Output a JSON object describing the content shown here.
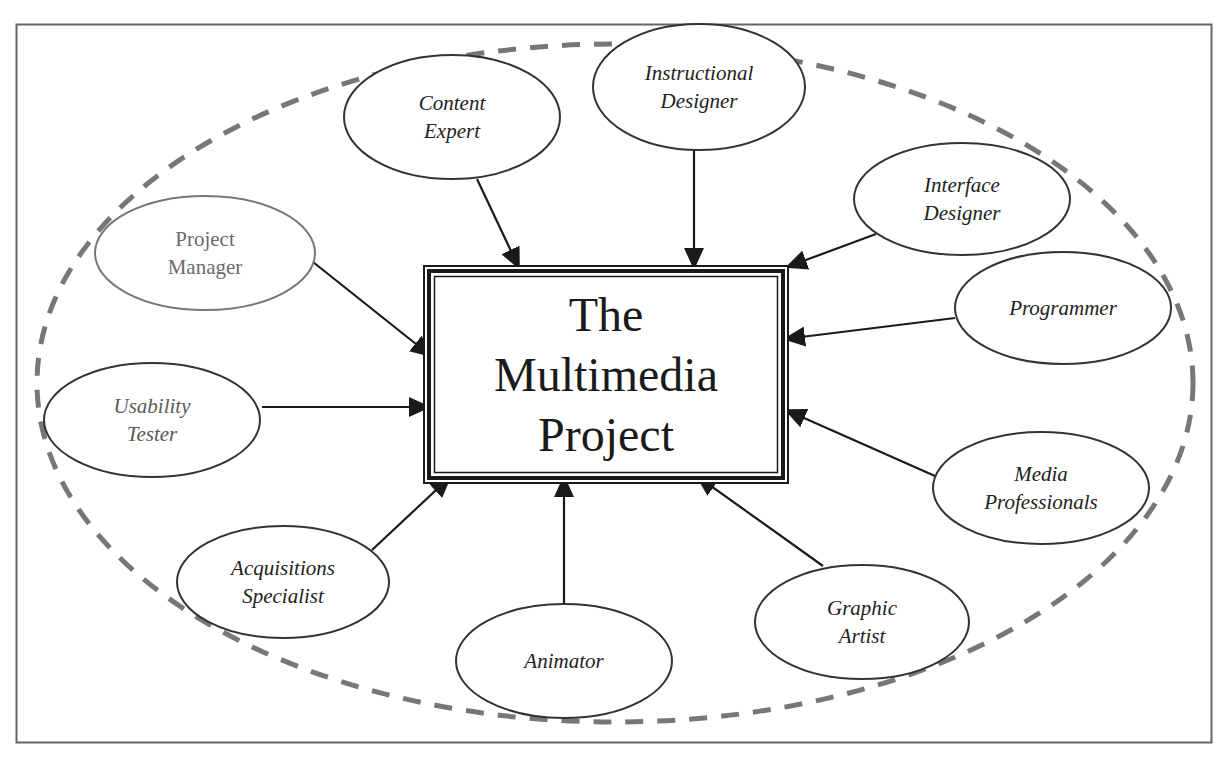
{
  "diagram": {
    "title_lines": [
      "The",
      "Multimedia",
      "Project"
    ],
    "colors": {
      "frame": "#666666",
      "dashed_ellipse": "#777777",
      "node_stroke": "#333333",
      "node_stroke_grey": "#777777",
      "arrow": "#1a1a1a",
      "text": "#222222"
    },
    "center_box": {
      "x": 424,
      "y": 266,
      "w": 364,
      "h": 217
    },
    "boundary": {
      "cx": 615,
      "cy": 383,
      "rx": 578,
      "ry": 339
    },
    "nodes": [
      {
        "id": "content-expert",
        "lines": [
          "Content",
          "Expert"
        ],
        "cx": 452,
        "cy": 117,
        "rx": 108,
        "ry": 62,
        "style": "italic",
        "arrow": {
          "x1": 477,
          "y1": 179,
          "x2": 519,
          "y2": 268
        }
      },
      {
        "id": "instructional-designer",
        "lines": [
          "Instructional",
          "Designer"
        ],
        "cx": 699,
        "cy": 87,
        "rx": 106,
        "ry": 63,
        "style": "italic",
        "arrow": {
          "x1": 694,
          "y1": 150,
          "x2": 694,
          "y2": 268
        }
      },
      {
        "id": "interface-designer",
        "lines": [
          "Interface",
          "Designer"
        ],
        "cx": 962,
        "cy": 199,
        "rx": 108,
        "ry": 56,
        "style": "italic",
        "arrow": {
          "x1": 876,
          "y1": 234,
          "x2": 787,
          "y2": 267
        }
      },
      {
        "id": "project-manager",
        "lines": [
          "Project",
          "Manager"
        ],
        "cx": 205,
        "cy": 253,
        "rx": 110,
        "ry": 57,
        "style": "upright",
        "arrow": {
          "x1": 313,
          "y1": 262,
          "x2": 431,
          "y2": 356
        }
      },
      {
        "id": "programmer",
        "lines": [
          "Programmer"
        ],
        "cx": 1063,
        "cy": 308,
        "rx": 108,
        "ry": 56,
        "style": "italic",
        "arrow": {
          "x1": 955,
          "y1": 318,
          "x2": 785,
          "y2": 339
        }
      },
      {
        "id": "usability-tester",
        "lines": [
          "Usability",
          "Tester"
        ],
        "cx": 152,
        "cy": 420,
        "rx": 108,
        "ry": 57,
        "style": "italic-grey",
        "arrow": {
          "x1": 262,
          "y1": 407,
          "x2": 429,
          "y2": 407
        }
      },
      {
        "id": "media-professionals",
        "lines": [
          "Media",
          "Professionals"
        ],
        "cx": 1041,
        "cy": 488,
        "rx": 108,
        "ry": 56,
        "style": "italic",
        "arrow": {
          "x1": 935,
          "y1": 476,
          "x2": 786,
          "y2": 410
        }
      },
      {
        "id": "acquisitions-specialist",
        "lines": [
          "Acquisitions",
          "Specialist"
        ],
        "cx": 283,
        "cy": 582,
        "rx": 106,
        "ry": 56,
        "style": "italic",
        "arrow": {
          "x1": 372,
          "y1": 550,
          "x2": 450,
          "y2": 477
        }
      },
      {
        "id": "graphic-artist",
        "lines": [
          "Graphic",
          "Artist"
        ],
        "cx": 862,
        "cy": 622,
        "rx": 107,
        "ry": 57,
        "style": "italic",
        "arrow": {
          "x1": 823,
          "y1": 566,
          "x2": 697,
          "y2": 476
        }
      },
      {
        "id": "animator",
        "lines": [
          "Animator"
        ],
        "cx": 564,
        "cy": 661,
        "rx": 108,
        "ry": 57,
        "style": "italic",
        "arrow": {
          "x1": 564,
          "y1": 604,
          "x2": 564,
          "y2": 477
        }
      }
    ]
  }
}
